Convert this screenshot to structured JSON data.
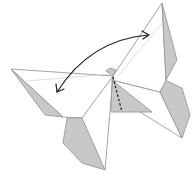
{
  "diagram": {
    "elements": [
      {
        "id": "left-wing",
        "kind": "paper-flap",
        "fill": "white"
      },
      {
        "id": "left-wing-reverse",
        "kind": "paper-flap",
        "fill": "shaded"
      },
      {
        "id": "right-wing",
        "kind": "paper-flap",
        "fill": "white"
      },
      {
        "id": "right-wing-reverse",
        "kind": "paper-flap",
        "fill": "shaded"
      },
      {
        "id": "bottom-left-flap",
        "kind": "paper-flap",
        "fill": "shaded"
      },
      {
        "id": "bottom-right-flap",
        "kind": "paper-flap",
        "fill": "shaded"
      },
      {
        "id": "center-triangle",
        "kind": "paper-flap",
        "fill": "shaded"
      },
      {
        "id": "valley-fold-line",
        "kind": "dashed-line"
      },
      {
        "id": "double-arrow",
        "kind": "curved-double-headed-arrow",
        "meaning": "swing wings back and forth"
      }
    ],
    "colors": {
      "paper_white": "#ffffff",
      "paper_shaded": "#c8c8c8",
      "outline": "#9a9a9a",
      "ink": "#1a1a1a"
    }
  }
}
